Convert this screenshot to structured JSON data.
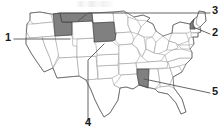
{
  "figure": {
    "width": 224,
    "height": 130,
    "background_color": "#ffffff"
  },
  "map": {
    "region": "United States (contiguous 48 states)",
    "state_fill_color": "#ffffff",
    "state_border_color": "#8c8c8c",
    "outline_color": "#4d4d4d",
    "highlight_fill_color": "#808080",
    "highlight_border_color": "#333333",
    "leader_line_color": "#555555",
    "highlighted_states": [
      "Idaho",
      "Montana",
      "South Dakota",
      "Vermont",
      "Mississippi"
    ]
  },
  "callouts": [
    {
      "number": "1",
      "target_state": "Idaho",
      "label_x": 5,
      "label_y": 33,
      "side": "left"
    },
    {
      "number": "2",
      "target_state": "Vermont",
      "label_x": 212,
      "label_y": 28,
      "side": "right"
    },
    {
      "number": "3",
      "target_state": "Montana",
      "label_x": 212,
      "label_y": 5,
      "side": "right"
    },
    {
      "number": "4",
      "target_state": "South Dakota",
      "label_x": 86,
      "label_y": 117,
      "side": "bottom"
    },
    {
      "number": "5",
      "target_state": "Mississippi",
      "label_x": 212,
      "label_y": 86,
      "side": "right"
    }
  ]
}
